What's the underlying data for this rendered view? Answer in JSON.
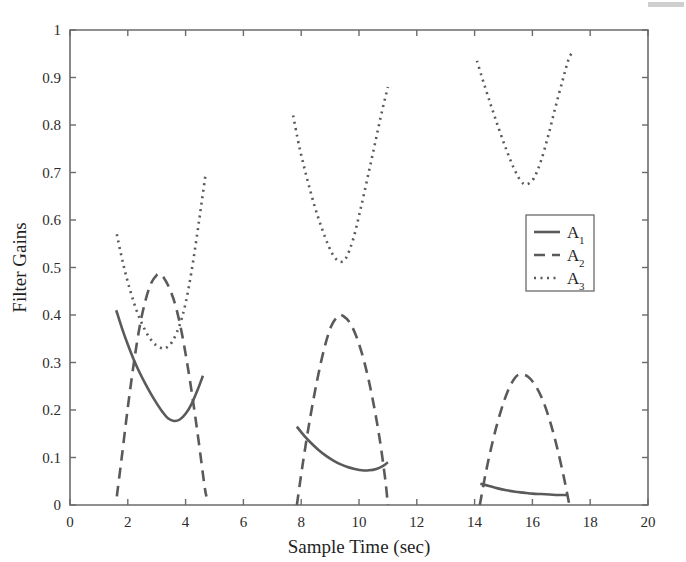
{
  "figure": {
    "background_color": "#ffffff",
    "line_color": "#5a5a5a",
    "axis_color": "#6b6b6b"
  },
  "chart_data": {
    "type": "line",
    "title": "",
    "xlabel": "Sample Time (sec)",
    "ylabel": "Filter Gains",
    "xlim": [
      0,
      20
    ],
    "ylim": [
      0,
      1
    ],
    "xticks": [
      0,
      2,
      4,
      6,
      8,
      10,
      12,
      14,
      16,
      18,
      20
    ],
    "yticks": [
      0,
      0.1,
      0.2,
      0.3,
      0.4,
      0.5,
      0.6,
      0.7,
      0.8,
      0.9,
      1
    ],
    "xticklabels": [
      "0",
      "2",
      "4",
      "6",
      "8",
      "10",
      "12",
      "14",
      "16",
      "18",
      "20"
    ],
    "yticklabels": [
      "0",
      "0.1",
      "0.2",
      "0.3",
      "0.4",
      "0.5",
      "0.6",
      "0.7",
      "0.8",
      "0.9",
      "1"
    ],
    "grid": false,
    "legend_position": "upper right",
    "series": [
      {
        "name": "A_1",
        "legend_base": "A",
        "legend_sub": "1",
        "style": "solid",
        "color": "#5a5a5a",
        "segments": [
          {
            "x": [
              1.6,
              1.8,
              2.0,
              2.2,
              2.4,
              2.6,
              2.8,
              3.0,
              3.2,
              3.4,
              3.6,
              3.8,
              4.0,
              4.2,
              4.4,
              4.6
            ],
            "y": [
              0.41,
              0.372,
              0.338,
              0.307,
              0.28,
              0.256,
              0.234,
              0.214,
              0.196,
              0.182,
              0.177,
              0.18,
              0.192,
              0.212,
              0.24,
              0.272
            ]
          },
          {
            "x": [
              7.85,
              8.1,
              8.35,
              8.6,
              8.85,
              9.1,
              9.35,
              9.6,
              9.85,
              10.1,
              10.35,
              10.6,
              10.85,
              11.0
            ],
            "y": [
              0.165,
              0.146,
              0.13,
              0.116,
              0.104,
              0.094,
              0.086,
              0.08,
              0.076,
              0.073,
              0.073,
              0.076,
              0.083,
              0.09
            ]
          },
          {
            "x": [
              14.2,
              14.5,
              14.8,
              15.1,
              15.4,
              15.7,
              16.0,
              16.3,
              16.6,
              16.9,
              17.2
            ],
            "y": [
              0.045,
              0.04,
              0.035,
              0.031,
              0.028,
              0.026,
              0.024,
              0.023,
              0.022,
              0.021,
              0.021
            ]
          }
        ]
      },
      {
        "name": "A_2",
        "legend_base": "A",
        "legend_sub": "2",
        "style": "dashed",
        "color": "#5a5a5a",
        "segments": [
          {
            "x": [
              1.62,
              1.8,
              2.0,
              2.2,
              2.4,
              2.6,
              2.8,
              3.0,
              3.1,
              3.25,
              3.45,
              3.65,
              3.85,
              4.05,
              4.25,
              4.45,
              4.65,
              4.72
            ],
            "y": [
              0.018,
              0.105,
              0.205,
              0.295,
              0.372,
              0.428,
              0.466,
              0.484,
              0.485,
              0.478,
              0.455,
              0.42,
              0.368,
              0.3,
              0.222,
              0.135,
              0.042,
              0.018
            ]
          },
          {
            "x": [
              7.85,
              8.05,
              8.3,
              8.55,
              8.8,
              9.05,
              9.3,
              9.45,
              9.7,
              9.95,
              10.2,
              10.45,
              10.7,
              10.9,
              11.0
            ],
            "y": [
              0.0,
              0.085,
              0.18,
              0.262,
              0.33,
              0.378,
              0.398,
              0.398,
              0.382,
              0.348,
              0.297,
              0.23,
              0.145,
              0.058,
              0.0
            ]
          },
          {
            "x": [
              14.18,
              14.4,
              14.65,
              14.9,
              15.15,
              15.4,
              15.6,
              15.85,
              16.1,
              16.35,
              16.6,
              16.85,
              17.1,
              17.28
            ],
            "y": [
              0.0,
              0.072,
              0.14,
              0.196,
              0.24,
              0.268,
              0.275,
              0.27,
              0.252,
              0.222,
              0.178,
              0.122,
              0.055,
              0.0
            ]
          }
        ]
      },
      {
        "name": "A_3",
        "legend_base": "A",
        "legend_sub": "3",
        "style": "dotted",
        "color": "#5a5a5a",
        "segments": [
          {
            "x": [
              1.62,
              1.85,
              2.1,
              2.35,
              2.6,
              2.85,
              3.1,
              3.3,
              3.55,
              3.8,
              4.0,
              4.2,
              4.4,
              4.55,
              4.7
            ],
            "y": [
              0.57,
              0.505,
              0.448,
              0.402,
              0.368,
              0.344,
              0.332,
              0.33,
              0.345,
              0.38,
              0.425,
              0.49,
              0.57,
              0.635,
              0.7
            ]
          },
          {
            "x": [
              7.72,
              7.95,
              8.2,
              8.45,
              8.7,
              8.95,
              9.15,
              9.35,
              9.55,
              9.8,
              10.05,
              10.3,
              10.55,
              10.8,
              11.0
            ],
            "y": [
              0.82,
              0.75,
              0.688,
              0.632,
              0.585,
              0.545,
              0.522,
              0.512,
              0.52,
              0.56,
              0.622,
              0.69,
              0.76,
              0.83,
              0.88
            ]
          },
          {
            "x": [
              14.08,
              14.35,
              14.6,
              14.85,
              15.1,
              15.35,
              15.6,
              15.8,
              16.05,
              16.3,
              16.55,
              16.8,
              17.05,
              17.25,
              17.4
            ],
            "y": [
              0.935,
              0.882,
              0.835,
              0.79,
              0.748,
              0.71,
              0.682,
              0.675,
              0.688,
              0.725,
              0.778,
              0.838,
              0.895,
              0.938,
              0.955
            ]
          }
        ]
      }
    ]
  }
}
